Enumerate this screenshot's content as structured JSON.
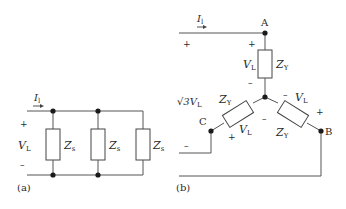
{
  "figure_a": {
    "panel_label": "(a)",
    "current_label": "I",
    "current_sub": "l",
    "voltage_label": "V",
    "voltage_sub": "L",
    "plus": "+",
    "minus": "–",
    "impedances": [
      {
        "label": "Z",
        "sub": "s"
      },
      {
        "label": "Z",
        "sub": "s"
      },
      {
        "label": "Z",
        "sub": "s"
      }
    ]
  },
  "figure_b": {
    "panel_label": "(b)",
    "current_label": "I",
    "current_sub": "l",
    "nodes": {
      "a": "A",
      "b": "B",
      "c": "C"
    },
    "line_voltage_label": "√3V",
    "line_voltage_sub": "L",
    "plus": "+",
    "minus": "–",
    "branches": [
      {
        "z": "Z",
        "z_sub": "Y",
        "v": "V",
        "v_sub": "L"
      },
      {
        "z": "Z",
        "z_sub": "Y",
        "v": "V",
        "v_sub": "L"
      },
      {
        "z": "Z",
        "z_sub": "Y",
        "v": "V",
        "v_sub": "L"
      }
    ]
  }
}
